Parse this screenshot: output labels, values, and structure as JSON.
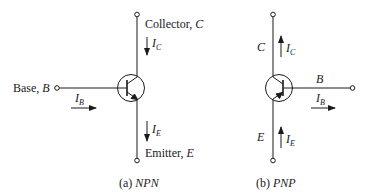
{
  "figure": {
    "npn": {
      "caption_prefix": "(a) ",
      "caption_type": "NPN",
      "collector_label": "Collector, ",
      "collector_symbol": "C",
      "base_label": "Base, ",
      "base_symbol": "B",
      "emitter_label": "Emitter, ",
      "emitter_symbol": "E",
      "current_collector": {
        "symbol": "I",
        "subscript": "C",
        "direction": "down"
      },
      "current_base": {
        "symbol": "I",
        "subscript": "B",
        "direction": "right"
      },
      "current_emitter": {
        "symbol": "I",
        "subscript": "E",
        "direction": "down"
      }
    },
    "pnp": {
      "caption_prefix": "(b) ",
      "caption_type": "PNP",
      "collector_symbol": "C",
      "base_symbol": "B",
      "emitter_symbol": "E",
      "current_collector": {
        "symbol": "I",
        "subscript": "C",
        "direction": "up"
      },
      "current_base": {
        "symbol": "I",
        "subscript": "B",
        "direction": "right"
      },
      "current_emitter": {
        "symbol": "I",
        "subscript": "E",
        "direction": "up"
      }
    },
    "colors": {
      "stroke": "#1a1a1a",
      "background": "#ffffff"
    }
  }
}
